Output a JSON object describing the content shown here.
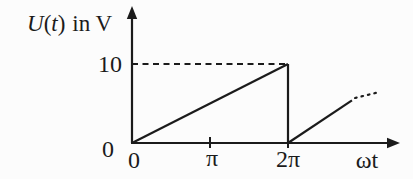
{
  "figure": {
    "background": "#fcfcfc",
    "ink_color": "#1b1b1b"
  },
  "chart_data": {
    "type": "line",
    "title": "",
    "xlabel": "ωt",
    "ylabel": "U(t) in V",
    "ylabel_parts": {
      "var": "U",
      "open": "(",
      "arg": "t",
      "close": ")",
      "suffix": "in V"
    },
    "x_unit_note": "x values are in multiples of π (radians)",
    "xlim": [
      0,
      3.4
    ],
    "ylim": [
      0,
      16
    ],
    "grid": false,
    "legend": false,
    "x_ticks": [
      {
        "value": 0,
        "label": "0",
        "tick_mark": false
      },
      {
        "value": 1,
        "label": "π",
        "tick_mark": true
      },
      {
        "value": 2,
        "label": "2π",
        "tick_mark": true
      }
    ],
    "y_ticks": [
      {
        "value": 0,
        "label": "0",
        "tick_mark": false
      },
      {
        "value": 10,
        "label": "10",
        "tick_mark": false
      }
    ],
    "series": [
      {
        "name": "U(t) sawtooth ramp",
        "segments": [
          {
            "style": "solid",
            "points": [
              [
                0,
                0
              ],
              [
                2,
                10
              ]
            ]
          },
          {
            "style": "solid",
            "points": [
              [
                2,
                10
              ],
              [
                2,
                0
              ]
            ]
          },
          {
            "style": "solid",
            "points": [
              [
                2,
                0
              ],
              [
                2.82,
                5.4
              ]
            ]
          },
          {
            "style": "dotted",
            "points": [
              [
                2.86,
                5.7
              ],
              [
                3.15,
                6.4
              ]
            ]
          }
        ]
      }
    ],
    "annotations": [
      {
        "type": "dashed_reference",
        "from": [
          0,
          10
        ],
        "to": [
          2,
          10
        ]
      }
    ],
    "waveform": {
      "shape": "sawtooth",
      "period": "2π",
      "peak_value": 10,
      "unit": "V"
    }
  }
}
